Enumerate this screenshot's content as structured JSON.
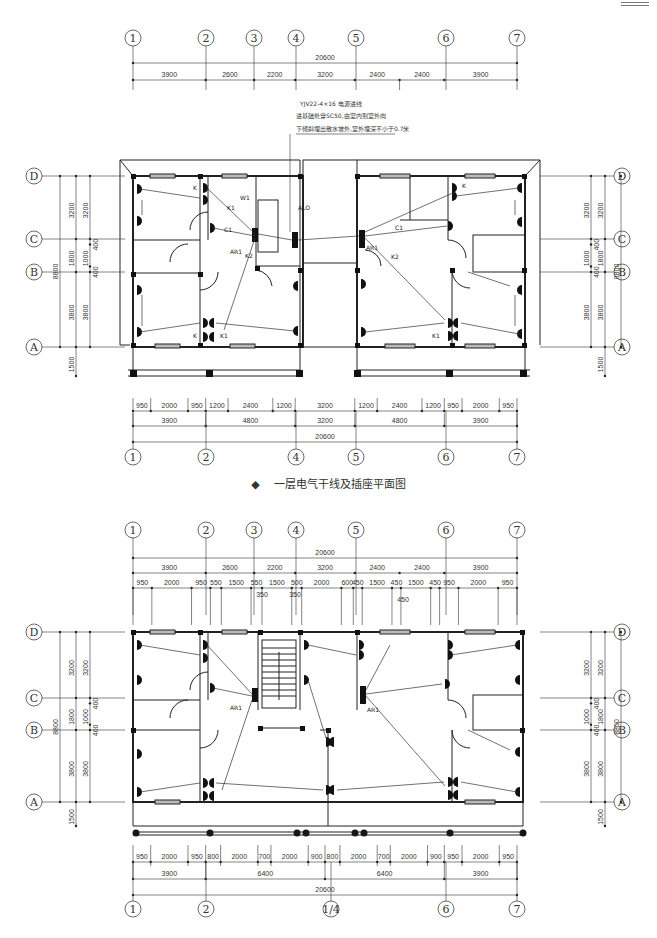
{
  "drawing": {
    "corner_mark": "",
    "plan1": {
      "title": "一层电气干线及插座平面图",
      "title_marker": "◆",
      "top_axes": [
        "1",
        "2",
        "3",
        "4",
        "5",
        "6",
        "7"
      ],
      "top_total": "20600",
      "top_bays": [
        "3900",
        "2600",
        "2200",
        "3200",
        "2400",
        "2400",
        "3900"
      ],
      "cable_note": [
        "YJV22-4×16 电源进线",
        "进基础处穿SC50,由室内到室外向",
        "下倾斜埋出散水坡外,室外埋深不小于0.7米"
      ],
      "panel_main": "ALO",
      "panel_left": "AR1",
      "panel_right": "AR1",
      "left_axes": [
        "D",
        "C",
        "B",
        "A"
      ],
      "left_dims_outer": [
        "8800"
      ],
      "left_dims_mid": [
        "3200",
        "1800",
        "3800",
        "1500"
      ],
      "left_dims_inner": [
        "3200",
        "400",
        "1000",
        "400",
        "3800"
      ],
      "right_dims_outer": [
        "8800"
      ],
      "right_dims_mid": [
        "3200",
        "1800",
        "3800",
        "1500"
      ],
      "right_dims_inner": [
        "3200",
        "400",
        "1000",
        "400",
        "3800"
      ],
      "bottom_row1": [
        "950",
        "2000",
        "950",
        "1200",
        "2400",
        "1200",
        "3200",
        "1200",
        "2400",
        "1200",
        "950",
        "2000",
        "950"
      ],
      "bottom_row2": [
        "3900",
        "4800",
        "3200",
        "4800",
        "3900"
      ],
      "bottom_total": "20600",
      "bottom_axes": [
        "1",
        "2",
        "4",
        "5",
        "6",
        "7"
      ],
      "circuit_labels": [
        "K",
        "W1",
        "K1",
        "C1",
        "K2",
        "K",
        "K1",
        "C1",
        "K2",
        "K",
        "K1"
      ]
    },
    "plan2": {
      "top_axes": [
        "1",
        "2",
        "3",
        "4",
        "5",
        "6",
        "7"
      ],
      "top_total": "20600",
      "top_bays": [
        "3900",
        "2600",
        "2200",
        "3200",
        "2400",
        "2400",
        "3900"
      ],
      "top_row3": [
        "950",
        "2000",
        "950",
        "550",
        "1500",
        "550",
        "1500",
        "500",
        "2000",
        "600",
        "450",
        "1500",
        "450",
        "1500",
        "450",
        "950",
        "2000",
        "950"
      ],
      "top_row3_below": [
        "350",
        "350",
        "450"
      ],
      "panel_left": "AR1",
      "panel_right": "AR1",
      "left_axes": [
        "D",
        "C",
        "B",
        "A"
      ],
      "left_dims_outer": [
        "8800"
      ],
      "left_dims_mid": [
        "3200",
        "1800",
        "3800",
        "1500"
      ],
      "left_dims_inner": [
        "3200",
        "400",
        "1000",
        "400",
        "3800"
      ],
      "bottom_row1": [
        "950",
        "2000",
        "950",
        "800",
        "2000",
        "700",
        "2000",
        "900",
        "800",
        "2000",
        "700",
        "2000",
        "900",
        "950",
        "2000",
        "950"
      ],
      "bottom_row2": [
        "3900",
        "6400",
        "6400",
        "3900"
      ],
      "bottom_total": "20600",
      "bottom_axes": [
        "1",
        "2",
        "1/4",
        "6",
        "7"
      ]
    }
  }
}
